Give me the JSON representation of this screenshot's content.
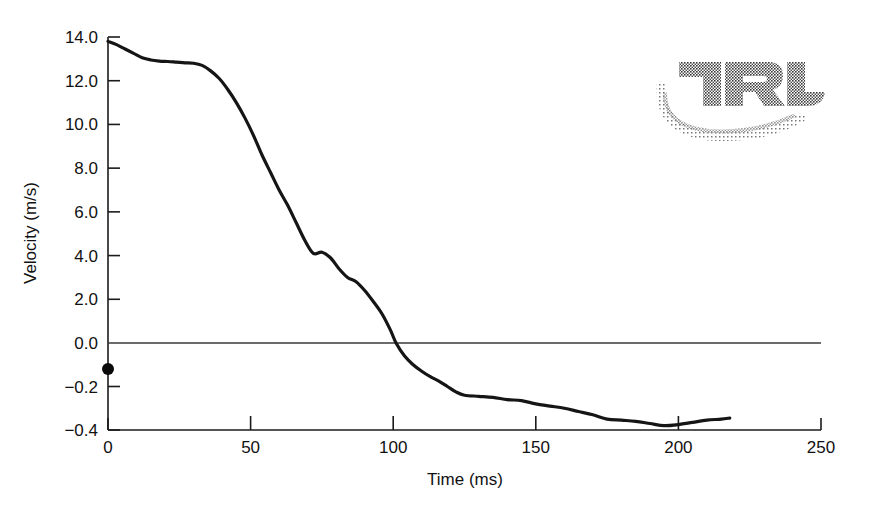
{
  "figure": {
    "background_color": "#ffffff",
    "line_color": "#151515",
    "axis_color": "#1b1b1b"
  },
  "logo": {
    "name": "TRL",
    "alt_text": "TRL",
    "style": "halftone-dithered-grey"
  },
  "chart_data": {
    "type": "line",
    "title": "",
    "xlabel": "Time (ms)",
    "ylabel": "Velocity (m/s)",
    "grid": false,
    "legend": null,
    "xlim": [
      0,
      250
    ],
    "xticks": [
      0,
      50,
      100,
      150,
      200,
      250
    ],
    "xtick_labels": [
      "0",
      "50",
      "100",
      "150",
      "200",
      "250"
    ],
    "y_axis_note": "broken / dual scale: 0.0 to 14.0 in steps of 2.0 above zero; 0.0 to -0.4 in steps of 0.2 below zero, each step the same pixel height",
    "yticks": [
      14.0,
      12.0,
      10.0,
      8.0,
      6.0,
      4.0,
      2.0,
      0.0,
      -0.2,
      -0.4
    ],
    "ytick_labels": [
      "14.0",
      "12.0",
      "10.0",
      "8.0",
      "6.0",
      "4.0",
      "2.0",
      "0.0",
      "−0.2",
      "−0.4"
    ],
    "zero_line": 0.0,
    "series": [
      {
        "name": "velocity",
        "x": [
          0,
          3,
          6,
          9,
          12,
          15,
          18,
          21,
          24,
          27,
          30,
          33,
          36,
          39,
          42,
          45,
          48,
          51,
          54,
          57,
          60,
          63,
          66,
          69,
          72,
          75,
          78,
          81,
          84,
          87,
          90,
          93,
          96,
          99,
          101,
          104,
          107,
          110,
          113,
          116,
          119,
          122,
          125,
          130,
          135,
          140,
          145,
          150,
          155,
          160,
          165,
          170,
          175,
          180,
          185,
          190,
          195,
          200,
          205,
          210,
          215,
          218
        ],
        "y": [
          13.8,
          13.65,
          13.45,
          13.25,
          13.05,
          12.95,
          12.9,
          12.88,
          12.85,
          12.82,
          12.8,
          12.7,
          12.45,
          12.1,
          11.6,
          11.0,
          10.3,
          9.5,
          8.6,
          7.8,
          7.0,
          6.3,
          5.5,
          4.7,
          4.1,
          4.15,
          3.9,
          3.4,
          3.0,
          2.8,
          2.4,
          1.9,
          1.35,
          0.6,
          0.0,
          -0.06,
          -0.1,
          -0.13,
          -0.155,
          -0.175,
          -0.2,
          -0.225,
          -0.24,
          -0.245,
          -0.25,
          -0.26,
          -0.265,
          -0.28,
          -0.29,
          -0.3,
          -0.315,
          -0.33,
          -0.35,
          -0.355,
          -0.36,
          -0.37,
          -0.38,
          -0.375,
          -0.365,
          -0.355,
          -0.35,
          -0.345
        ]
      }
    ],
    "point_markers": [
      {
        "name": "origin-marker",
        "x": 0,
        "y": -0.12,
        "label": ""
      }
    ]
  }
}
